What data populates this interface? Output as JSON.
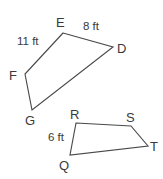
{
  "figure": {
    "background_color": "#ffffff",
    "stroke_color": "#4a4a4a",
    "text_color": "#3a3a3a",
    "units": "ft",
    "shapes": [
      {
        "id": "upper",
        "name": "quadrilateral-defg",
        "vertex_order": "E, D, G, F",
        "vertices": [
          {
            "label": "E",
            "x": 63,
            "y": 33,
            "label_x": 56,
            "label_y": 27
          },
          {
            "label": "D",
            "x": 113,
            "y": 47,
            "label_x": 117,
            "label_y": 53
          },
          {
            "label": "G",
            "x": 32,
            "y": 110,
            "label_x": 25,
            "label_y": 125
          },
          {
            "label": "F",
            "x": 25,
            "y": 74,
            "label_x": 9,
            "label_y": 80
          }
        ],
        "measures": [
          {
            "value": "11 ft",
            "edge": "E-F",
            "x": 17,
            "y": 45
          },
          {
            "value": "8 ft",
            "edge": "E-D",
            "x": 83,
            "y": 30
          }
        ]
      },
      {
        "id": "lower",
        "name": "quadrilateral-qrst",
        "vertex_order": "R, S, T, Q",
        "vertices": [
          {
            "label": "R",
            "x": 76,
            "y": 123,
            "label_x": 70,
            "label_y": 119
          },
          {
            "label": "S",
            "x": 131,
            "y": 126,
            "label_x": 126,
            "label_y": 122
          },
          {
            "label": "T",
            "x": 148,
            "y": 146,
            "label_x": 150,
            "label_y": 151
          },
          {
            "label": "Q",
            "x": 70,
            "y": 155,
            "label_x": 59,
            "label_y": 170
          }
        ],
        "measures": [
          {
            "value": "6 ft",
            "edge": "Q-R",
            "x": 48,
            "y": 141
          }
        ]
      }
    ]
  }
}
